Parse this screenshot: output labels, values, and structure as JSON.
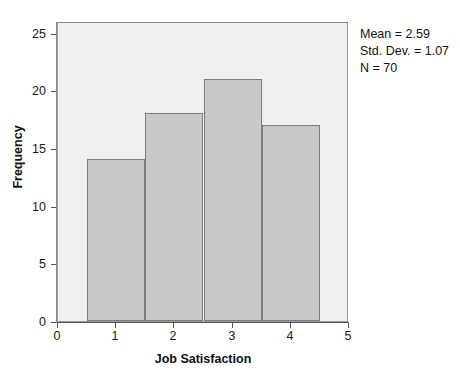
{
  "chart_data": {
    "type": "bar",
    "title": "",
    "subtitle": "",
    "xlabel": "Job Satisfaction",
    "ylabel": "Frequency",
    "categories": [
      "1",
      "2",
      "3",
      "4"
    ],
    "values": [
      14,
      18,
      21,
      17
    ],
    "bin_edges": [
      0.5,
      1.5,
      2.5,
      3.5,
      4.5
    ],
    "xlim": [
      0,
      5
    ],
    "ylim": [
      0,
      26
    ],
    "xticks": [
      "0",
      "1",
      "2",
      "3",
      "4",
      "5"
    ],
    "xtick_values": [
      0,
      1,
      2,
      3,
      4,
      5
    ],
    "yticks": [
      "0",
      "5",
      "10",
      "15",
      "20",
      "25"
    ],
    "ytick_values": [
      0,
      5,
      10,
      15,
      20,
      25
    ],
    "grid": false,
    "legend": "none",
    "bar_fill_color": "#c9c9c9",
    "bar_edge_color": "#7d7d7d",
    "panel_background": "#f0f0f0",
    "annotations": {
      "mean": "Mean = 2.59",
      "std_dev": "Std. Dev. = 1.07",
      "n": "N = 70"
    }
  }
}
